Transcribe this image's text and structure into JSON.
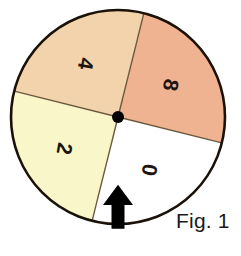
{
  "figure": {
    "caption": "Fig. 1",
    "type": "spinner-wheel",
    "background_color": "#ffffff"
  },
  "spinner": {
    "center": {
      "x": 118,
      "y": 117
    },
    "radius": 107,
    "outline_color": "#1a1208",
    "outline_width": 2.6,
    "divider_color": "#6b5a3e",
    "divider_width": 1.4,
    "pivot": {
      "name": "center-pivot-dot",
      "radius": 6,
      "color": "#000000"
    },
    "sectors": [
      {
        "label": "8",
        "fill": "#f0b391",
        "start_angle": -76,
        "end_angle": 14,
        "label_radius": 62,
        "label_angle": -31,
        "label_rotation": 100
      },
      {
        "label": "0",
        "fill": "#ffffff",
        "start_angle": 14,
        "end_angle": 104,
        "label_radius": 62,
        "label_angle": 59,
        "label_rotation": 100
      },
      {
        "label": "2",
        "fill": "#f9f7c9",
        "start_angle": 104,
        "end_angle": 194,
        "label_radius": 62,
        "label_angle": 149,
        "label_rotation": 100
      },
      {
        "label": "4",
        "fill": "#f2d3ab",
        "start_angle": 194,
        "end_angle": 284,
        "label_radius": 62,
        "label_angle": 239,
        "label_rotation": 100
      }
    ]
  },
  "pointer": {
    "name": "spinner-arrow",
    "color": "#000000",
    "direction": "up",
    "position": {
      "x": 118,
      "y": 212
    },
    "shaft_width": 13,
    "head_width": 30,
    "total_height": 44
  },
  "caption_position": {
    "x": 176,
    "y": 228
  }
}
